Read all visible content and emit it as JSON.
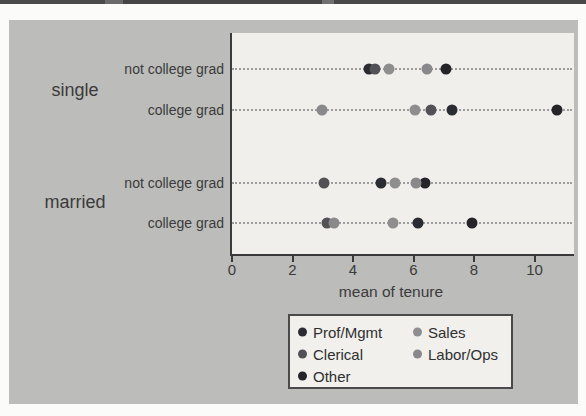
{
  "chart": {
    "outer_background": "#bcbcba",
    "plot_background": "#f0efec",
    "axis_color": "#3a3a3a",
    "grid_color": "#9c9c9c",
    "text_color": "#3b3b3b",
    "top_rule_color": "#4a4a4a"
  },
  "chart_data": {
    "type": "scatter",
    "subtype": "dot-plot",
    "title": "",
    "xlabel": "mean of tenure",
    "ylabel": "",
    "xlim": [
      0,
      11.3
    ],
    "xticks": [
      0,
      2,
      4,
      6,
      8,
      10
    ],
    "xtick_labels": [
      "0",
      "2",
      "4",
      "6",
      "8",
      "10"
    ],
    "grid": "horizontal dotted lines per category row",
    "legend_position": "below-axis, 2 columns",
    "groups": [
      {
        "label": "single"
      },
      {
        "label": "married"
      }
    ],
    "rows": [
      {
        "group": "single",
        "label": "not college grad"
      },
      {
        "group": "single",
        "label": "college grad"
      },
      {
        "group": "married",
        "label": "not college grad"
      },
      {
        "group": "married",
        "label": "college grad"
      }
    ],
    "series": [
      {
        "name": "Prof/Mgmt",
        "color": "#2b2b33",
        "values": [
          4.5,
          7.25,
          4.9,
          6.1
        ]
      },
      {
        "name": "Clerical",
        "color": "#515156",
        "values": [
          4.7,
          6.55,
          3.0,
          3.1
        ]
      },
      {
        "name": "Other",
        "color": "#242429",
        "values": [
          7.05,
          10.7,
          6.35,
          7.9
        ]
      },
      {
        "name": "Sales",
        "color": "#8e8e8e",
        "values": [
          5.15,
          6.0,
          5.35,
          5.3
        ]
      },
      {
        "name": "Labor/Ops",
        "color": "#89898c",
        "values": [
          6.4,
          2.95,
          6.05,
          3.35
        ]
      }
    ],
    "legend": {
      "order": [
        "Prof/Mgmt",
        "Clerical",
        "Other",
        "Sales",
        "Labor/Ops"
      ],
      "columns": 2
    }
  }
}
